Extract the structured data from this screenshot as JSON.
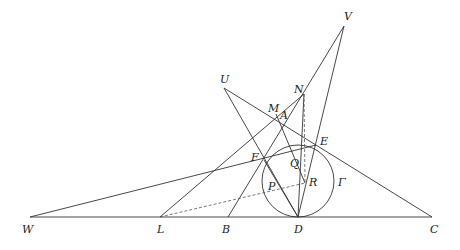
{
  "diagram": {
    "type": "geometry-construction",
    "stroke_color": "#333333",
    "dash_color": "#555555",
    "points": {
      "W": {
        "label": "W",
        "x": 30,
        "y": 217,
        "lx": 22,
        "ly": 224
      },
      "L": {
        "label": "L",
        "x": 160,
        "y": 217,
        "lx": 157,
        "ly": 224
      },
      "B": {
        "label": "B",
        "x": 228,
        "y": 217,
        "lx": 222,
        "ly": 224
      },
      "D": {
        "label": "D",
        "x": 298,
        "y": 217,
        "lx": 294,
        "ly": 224
      },
      "C": {
        "label": "C",
        "x": 432,
        "y": 217,
        "lx": 430,
        "ly": 224
      },
      "V": {
        "label": "V",
        "x": 344,
        "y": 26,
        "lx": 344,
        "ly": 11
      },
      "U": {
        "label": "U",
        "x": 224,
        "y": 88,
        "lx": 220,
        "ly": 74
      },
      "N": {
        "label": "N",
        "x": 304,
        "y": 94,
        "lx": 294,
        "ly": 84
      },
      "M": {
        "label": "M",
        "x": 276,
        "y": 114,
        "lx": 268,
        "ly": 103
      },
      "A": {
        "label": "A",
        "x": 283,
        "y": 116,
        "lx": 280,
        "ly": 110
      },
      "E": {
        "label": "E",
        "x": 316,
        "y": 145,
        "lx": 320,
        "ly": 136
      },
      "F": {
        "label": "F",
        "x": 264,
        "y": 160,
        "lx": 251,
        "ly": 152
      },
      "Q": {
        "label": "Q",
        "x": 291,
        "y": 150,
        "lx": 290,
        "ly": 158
      },
      "P": {
        "label": "P",
        "x": 280,
        "y": 183,
        "lx": 268,
        "ly": 181
      },
      "R": {
        "label": "R",
        "x": 305,
        "y": 183,
        "lx": 309,
        "ly": 177
      },
      "Gamma": {
        "label": "Γ",
        "x": 0,
        "y": 0,
        "lx": 338,
        "ly": 177
      }
    },
    "circle": {
      "name": "Γ",
      "cx": 298,
      "cy": 181,
      "r": 36
    },
    "solid_segments": [
      [
        "W",
        "C"
      ],
      [
        "W",
        "E"
      ],
      [
        "B",
        "V"
      ],
      [
        "D",
        "V"
      ],
      [
        "U",
        "C"
      ],
      [
        "U",
        "D"
      ],
      [
        "L",
        "N"
      ],
      [
        "N",
        "D"
      ],
      [
        "M",
        "R"
      ],
      [
        "F",
        "D"
      ]
    ],
    "dashed_segments": [
      [
        "L",
        "R"
      ],
      [
        "N",
        "R"
      ]
    ]
  }
}
